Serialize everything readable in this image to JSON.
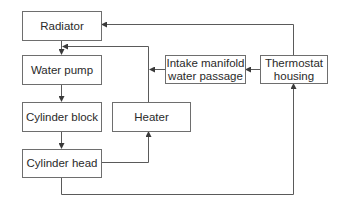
{
  "diagram": {
    "type": "flowchart",
    "nodes": {
      "radiator": {
        "label": "Radiator"
      },
      "water_pump": {
        "label": "Water pump"
      },
      "cylinder_block": {
        "label": "Cylinder block"
      },
      "cylinder_head": {
        "label": "Cylinder head"
      },
      "heater": {
        "label": "Heater"
      },
      "intake_manifold": {
        "label": "Intake manifold\nwater  passage"
      },
      "thermostat_housing": {
        "label": "Thermostat\nhousing"
      }
    },
    "edges": [
      {
        "from": "Radiator",
        "to": "Water pump"
      },
      {
        "from": "Water pump",
        "to": "Cylinder block"
      },
      {
        "from": "Cylinder block",
        "to": "Cylinder head"
      },
      {
        "from": "Cylinder head",
        "to": "Heater"
      },
      {
        "from": "Cylinder head",
        "to": "Thermostat housing"
      },
      {
        "from": "Heater",
        "to": "Water pump"
      },
      {
        "from": "Thermostat housing",
        "to": "Radiator"
      },
      {
        "from": "Thermostat housing",
        "to": "Intake manifold water passage"
      },
      {
        "from": "Intake manifold water passage",
        "to": "Heater return line"
      }
    ],
    "colors": {
      "line": "#5a5a5a",
      "border": "#6e6e6e",
      "text": "#2a2a2a"
    }
  }
}
